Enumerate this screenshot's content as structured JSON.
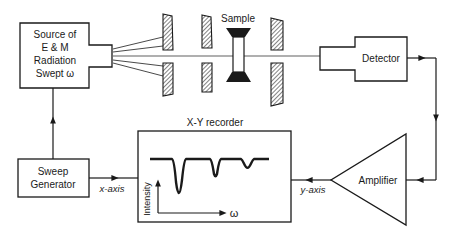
{
  "diagram": {
    "type": "block-diagram",
    "colors": {
      "ink": "#1a1a1a",
      "background": "#ffffff",
      "hatch": "#1a1a1a"
    },
    "blocks": {
      "source": {
        "lines": [
          "Source of",
          "E & M",
          "Radiation",
          "Swept ω"
        ]
      },
      "sample": {
        "label": "Sample"
      },
      "detector": {
        "label": "Detector"
      },
      "sweep_generator": {
        "lines": [
          "Sweep",
          "Generator"
        ]
      },
      "recorder": {
        "title": "X-Y recorder",
        "y_label": "Intensity",
        "x_label": "ω"
      },
      "amplifier": {
        "label": "Amplifier"
      }
    },
    "connections": [
      {
        "from": "sweep_generator",
        "to": "source",
        "label": ""
      },
      {
        "from": "source",
        "to": "detector",
        "label": "beam through slits and sample"
      },
      {
        "from": "detector",
        "to": "amplifier",
        "label": ""
      },
      {
        "from": "amplifier",
        "to": "recorder",
        "label": "y-axis"
      },
      {
        "from": "sweep_generator",
        "to": "recorder",
        "label": "x-axis"
      }
    ],
    "edge_labels": {
      "x_axis": "x-axis",
      "y_axis": "y-axis"
    },
    "slits": 3,
    "spectrum_dips": [
      {
        "position": "first",
        "depth": "large"
      },
      {
        "position": "second",
        "depth": "medium"
      },
      {
        "position": "third",
        "depth": "small"
      }
    ]
  }
}
